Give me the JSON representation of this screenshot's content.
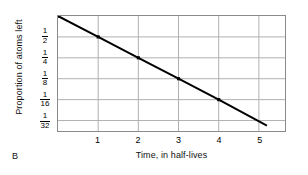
{
  "panel": {
    "label": "B"
  },
  "chart_data": {
    "type": "line",
    "title": "",
    "subtitle": "",
    "xlabel": "Time, in half-lives",
    "ylabel": "Proportion of atoms left",
    "x": [
      0,
      1,
      2,
      3,
      4,
      5.2
    ],
    "values": [
      1,
      0.5,
      0.25,
      0.125,
      0.0625,
      0.0264
    ],
    "y_display_values": [
      "1",
      "1/2",
      "1/4",
      "1/8",
      "1/16",
      "1/32"
    ],
    "y_scale": "log2",
    "xlim": [
      0,
      5.65
    ],
    "ylim_exponent": [
      0,
      -5.5
    ],
    "xticks": [
      1,
      2,
      3,
      4,
      5
    ],
    "xtick_labels": [
      "1",
      "2",
      "3",
      "4",
      "5"
    ],
    "yticks_exponent": [
      -1,
      -2,
      -3,
      -4,
      -5
    ],
    "ytick_labels": [
      {
        "numerator": "1",
        "denominator": "2"
      },
      {
        "numerator": "1",
        "denominator": "4"
      },
      {
        "numerator": "1",
        "denominator": "8"
      },
      {
        "numerator": "1",
        "denominator": "16"
      },
      {
        "numerator": "1",
        "denominator": "32"
      }
    ],
    "grid": true,
    "legend": "none",
    "series": [
      {
        "name": "Proportion of atoms left",
        "marker": "square",
        "color": "#000000",
        "points": [
          {
            "x": 0,
            "y_label": "1",
            "marker": true
          },
          {
            "x": 1,
            "y_label": "1/2",
            "marker": true
          },
          {
            "x": 2,
            "y_label": "1/4",
            "marker": true
          },
          {
            "x": 3,
            "y_label": "1/8",
            "marker": true
          },
          {
            "x": 4,
            "y_label": "1/16",
            "marker": true
          },
          {
            "x": 5.2,
            "y_label": "",
            "marker": false
          }
        ]
      }
    ],
    "colors": {
      "line": "#000000",
      "marker": "#000000",
      "grid": "#b0b0b0",
      "axis_border": "#8a8a8a",
      "background": "#ffffff",
      "text": "#111111"
    }
  }
}
